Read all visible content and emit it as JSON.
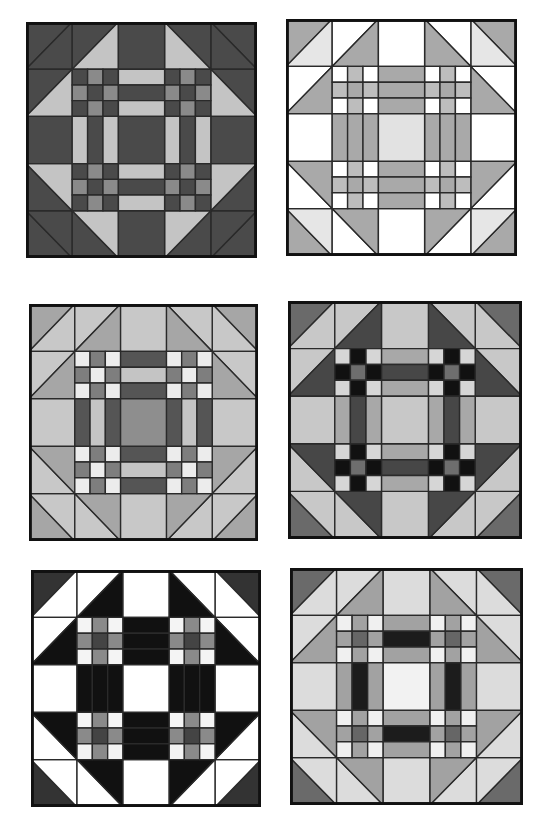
{
  "blocks": [
    {
      "id": "block-1",
      "box": {
        "x": 26,
        "y": 22,
        "w": 231,
        "h": 236
      },
      "colors": {
        "bg": "#4a4a4a",
        "point": "#c4c4c4",
        "cornerA": "#4a4a4a",
        "cornerB": "#4a4a4a",
        "plain": "#4a4a4a",
        "np": [
          "#4a4a4a",
          "#8a8a8a",
          "#4a4a4a",
          "#8a8a8a",
          "#4a4a4a",
          "#8a8a8a",
          "#4a4a4a",
          "#8a8a8a",
          "#4a4a4a"
        ],
        "strip": [
          "#c4c4c4",
          "#4a4a4a",
          "#c4c4c4"
        ],
        "center": "#4a4a4a"
      }
    },
    {
      "id": "block-2",
      "box": {
        "x": 286,
        "y": 19,
        "w": 231,
        "h": 237
      },
      "colors": {
        "bg": "#ffffff",
        "point": "#a9a9a9",
        "cornerA": "#a9a9a9",
        "cornerB": "#e6e6e6",
        "plain": "#ffffff",
        "np": [
          "#ffffff",
          "#bdbdbd",
          "#ffffff",
          "#bdbdbd",
          "#a9a9a9",
          "#bdbdbd",
          "#ffffff",
          "#bdbdbd",
          "#ffffff"
        ],
        "strip": [
          "#a9a9a9",
          "#a9a9a9",
          "#a9a9a9"
        ],
        "center": "#e2e2e2"
      }
    },
    {
      "id": "block-3",
      "box": {
        "x": 29,
        "y": 304,
        "w": 229,
        "h": 237
      },
      "colors": {
        "bg": "#c8c8c8",
        "point": "#a6a6a6",
        "cornerA": "#a6a6a6",
        "cornerB": "#c8c8c8",
        "plain": "#c8c8c8",
        "np": [
          "#ececec",
          "#7e7e7e",
          "#ececec",
          "#7e7e7e",
          "#ececec",
          "#7e7e7e",
          "#ececec",
          "#7e7e7e",
          "#ececec"
        ],
        "strip": [
          "#555555",
          "#c4c4c4",
          "#555555"
        ],
        "center": "#8e8e8e"
      }
    },
    {
      "id": "block-4",
      "box": {
        "x": 288,
        "y": 301,
        "w": 234,
        "h": 238
      },
      "colors": {
        "bg": "#c8c8c8",
        "point": "#474747",
        "cornerA": "#6a6a6a",
        "cornerB": "#c8c8c8",
        "plain": "#c8c8c8",
        "np": [
          "#d6d6d6",
          "#111111",
          "#d6d6d6",
          "#111111",
          "#6e6e6e",
          "#111111",
          "#d6d6d6",
          "#111111",
          "#d6d6d6"
        ],
        "strip": [
          "#a8a8a8",
          "#474747",
          "#a8a8a8"
        ],
        "center": "#c8c8c8"
      }
    },
    {
      "id": "block-5",
      "box": {
        "x": 31,
        "y": 570,
        "w": 230,
        "h": 237
      },
      "colors": {
        "bg": "#ffffff",
        "point": "#111111",
        "cornerA": "#333333",
        "cornerB": "#ffffff",
        "plain": "#ffffff",
        "np": [
          "#f4f4f4",
          "#8a8a8a",
          "#f4f4f4",
          "#8a8a8a",
          "#444444",
          "#8a8a8a",
          "#f4f4f4",
          "#8a8a8a",
          "#f4f4f4"
        ],
        "strip": [
          "#111111",
          "#111111",
          "#111111"
        ],
        "center": "#ffffff"
      }
    },
    {
      "id": "block-6",
      "box": {
        "x": 290,
        "y": 568,
        "w": 233,
        "h": 237
      },
      "colors": {
        "bg": "#dcdcdc",
        "point": "#a2a2a2",
        "cornerA": "#6a6a6a",
        "cornerB": "#dcdcdc",
        "plain": "#dcdcdc",
        "np": [
          "#f0f0f0",
          "#a2a2a2",
          "#f0f0f0",
          "#a2a2a2",
          "#666666",
          "#a2a2a2",
          "#f0f0f0",
          "#a2a2a2",
          "#f0f0f0"
        ],
        "strip": [
          "#a2a2a2",
          "#1c1c1c",
          "#a2a2a2"
        ],
        "center": "#f2f2f2"
      }
    }
  ]
}
